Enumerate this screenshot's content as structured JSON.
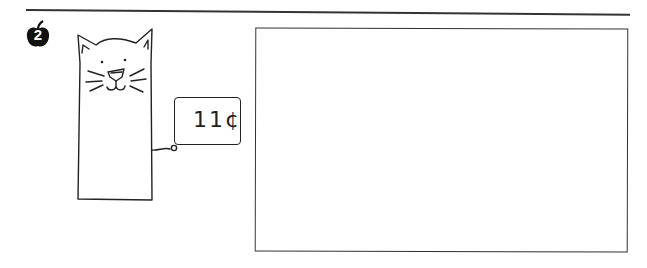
{
  "problem": {
    "number": "2",
    "number_icon": "apple-icon"
  },
  "illustration": {
    "subject": "cat-puppet",
    "price_tag": {
      "price": "11¢"
    }
  },
  "answer_box": {
    "value": ""
  },
  "colors": {
    "ink": "#222222",
    "background": "#ffffff"
  }
}
